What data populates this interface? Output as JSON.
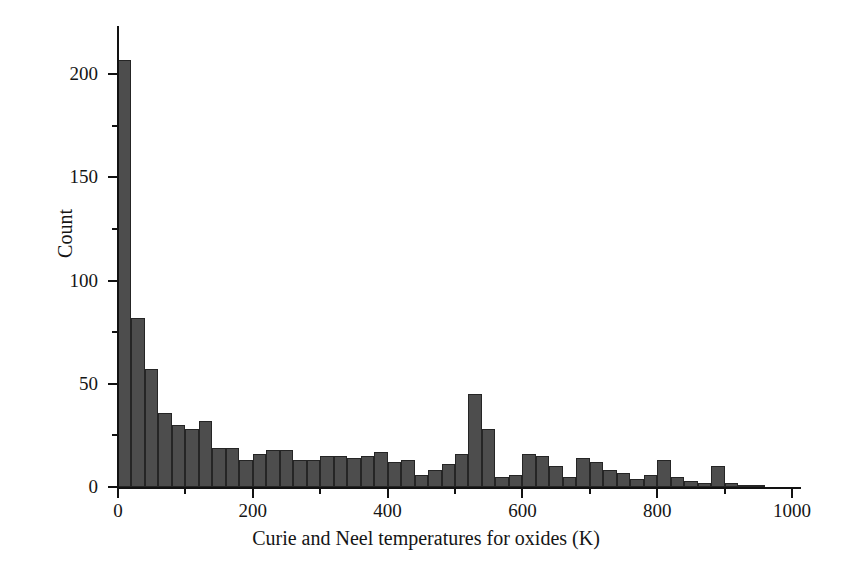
{
  "chart_data": {
    "type": "bar",
    "title": "",
    "subtitle": "",
    "xlabel": "Curie and Neel temperatures for oxides (K)",
    "ylabel": "Count",
    "xlim": [
      0,
      1000
    ],
    "ylim": [
      0,
      215
    ],
    "grid": false,
    "legend": null,
    "bin_width": 20,
    "x_ticks": [
      0,
      200,
      400,
      600,
      800,
      1000
    ],
    "x_tick_labels": [
      "0",
      "200",
      "400",
      "600",
      "800",
      "1000"
    ],
    "x_minor_ticks": [
      100,
      300,
      500,
      700,
      900
    ],
    "y_ticks": [
      0,
      50,
      100,
      150,
      200
    ],
    "y_tick_labels": [
      "0",
      "50",
      "100",
      "150",
      "200"
    ],
    "y_minor_ticks": [
      25,
      75,
      125,
      175
    ],
    "bar_color": "#4d4d4d",
    "bar_edge_color": "#252525",
    "axis_color": "#121212",
    "background_color": "#ffffff",
    "bins": [
      0,
      20,
      40,
      60,
      80,
      100,
      120,
      140,
      160,
      180,
      200,
      220,
      240,
      260,
      280,
      300,
      320,
      340,
      360,
      380,
      400,
      420,
      440,
      460,
      480,
      500,
      520,
      540,
      560,
      580,
      600,
      620,
      640,
      660,
      680,
      700,
      720,
      740,
      760,
      780,
      800,
      820,
      840,
      860,
      880,
      900,
      920,
      940,
      960,
      980
    ],
    "values": [
      207,
      82,
      57,
      36,
      30,
      28,
      32,
      19,
      19,
      13,
      16,
      18,
      18,
      13,
      13,
      15,
      15,
      14,
      15,
      17,
      12,
      13,
      6,
      8,
      11,
      16,
      45,
      28,
      5,
      6,
      16,
      15,
      10,
      5,
      14,
      12,
      8,
      7,
      4,
      6,
      13,
      5,
      3,
      2,
      10,
      2,
      1,
      1,
      0,
      0
    ]
  }
}
